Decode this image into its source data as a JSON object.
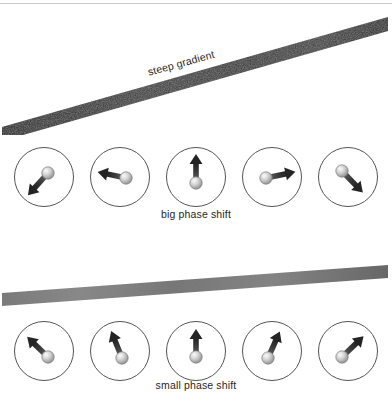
{
  "figure": {
    "background_color": "#ffffff",
    "top_rule_color": "#c9c9c9"
  },
  "panels": [
    {
      "id": "steep",
      "bar_label": "steep gradient",
      "bar": {
        "orientation": "diagonal-rising",
        "slope_deg": -15.5,
        "color_dark": "#272727",
        "color_light": "#3a3a3a",
        "thickness_px": 13,
        "x_start": 2,
        "y_start": 124,
        "x_end": 388,
        "y_end": 14
      },
      "caption": "big phase shift",
      "spins": [
        {
          "index": 1,
          "angle_deg": 228,
          "label": "spin-1"
        },
        {
          "index": 2,
          "angle_deg": 168,
          "label": "spin-2"
        },
        {
          "index": 3,
          "angle_deg": 90,
          "label": "spin-3"
        },
        {
          "index": 4,
          "angle_deg": 12,
          "label": "spin-4"
        },
        {
          "index": 5,
          "angle_deg": -46,
          "label": "spin-5"
        }
      ]
    },
    {
      "id": "shallow",
      "bar_label": "shallow gradient",
      "bar": {
        "orientation": "diagonal-rising-slight",
        "slope_deg": -4.2,
        "color_dark": "#6f6f6f",
        "color_light": "#8e8e8e",
        "thickness_px": 13,
        "x_start": 2,
        "y_start": 40,
        "x_end": 388,
        "y_end": 12
      },
      "caption": "small phase shift",
      "spins": [
        {
          "index": 1,
          "angle_deg": 136,
          "label": "spin-1"
        },
        {
          "index": 2,
          "angle_deg": 112,
          "label": "spin-2"
        },
        {
          "index": 3,
          "angle_deg": 90,
          "label": "spin-3"
        },
        {
          "index": 4,
          "angle_deg": 66,
          "label": "spin-4"
        },
        {
          "index": 5,
          "angle_deg": 44,
          "label": "spin-5"
        }
      ]
    }
  ],
  "style": {
    "circle_stroke": "#4a4a4a",
    "arrow_dark": "#2f2f2f",
    "arrow_mid": "#5d5d5d",
    "sphere_light": "#efefef",
    "sphere_mid": "#b9b9b9",
    "sphere_dark": "#8a8a8a",
    "text_color": "#1f1f1f"
  }
}
